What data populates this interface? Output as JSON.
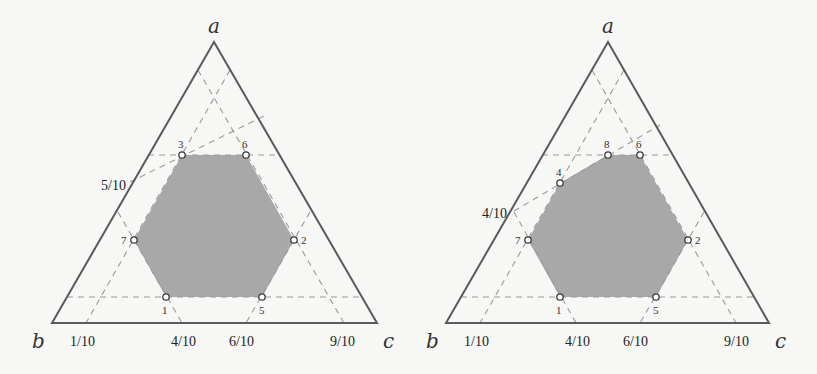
{
  "diagrams": [
    {
      "id": "left",
      "vertices": {
        "a": {
          "label": "a",
          "x": 214,
          "y": 42
        },
        "b": {
          "label": "b",
          "x": 52,
          "y": 323
        },
        "c": {
          "label": "c",
          "x": 377,
          "y": 323
        }
      },
      "points": [
        {
          "label": "1",
          "x": 166,
          "y": 297
        },
        {
          "label": "2",
          "x": 294,
          "y": 240
        },
        {
          "label": "3",
          "x": 182,
          "y": 155
        },
        {
          "label": "5",
          "x": 262,
          "y": 297
        },
        {
          "label": "6",
          "x": 246,
          "y": 155
        },
        {
          "label": "7",
          "x": 134,
          "y": 240
        }
      ],
      "region_color": "#a8a8a8",
      "bottom_ticks": [
        "1/10",
        "4/10",
        "6/10",
        "9/10"
      ],
      "side_tick": "5/10"
    },
    {
      "id": "right",
      "vertices": {
        "a": {
          "label": "a",
          "x": 608,
          "y": 42
        },
        "b": {
          "label": "b",
          "x": 446,
          "y": 323
        },
        "c": {
          "label": "c",
          "x": 769,
          "y": 323
        }
      },
      "points": [
        {
          "label": "1",
          "x": 560,
          "y": 297
        },
        {
          "label": "2",
          "x": 688,
          "y": 240
        },
        {
          "label": "4",
          "x": 560,
          "y": 183
        },
        {
          "label": "5",
          "x": 656,
          "y": 297
        },
        {
          "label": "6",
          "x": 640,
          "y": 155
        },
        {
          "label": "7",
          "x": 528,
          "y": 240
        },
        {
          "label": "8",
          "x": 608,
          "y": 155
        }
      ],
      "region_color": "#a8a8a8",
      "bottom_ticks": [
        "1/10",
        "4/10",
        "6/10",
        "9/10"
      ],
      "side_tick": "4/10"
    }
  ]
}
